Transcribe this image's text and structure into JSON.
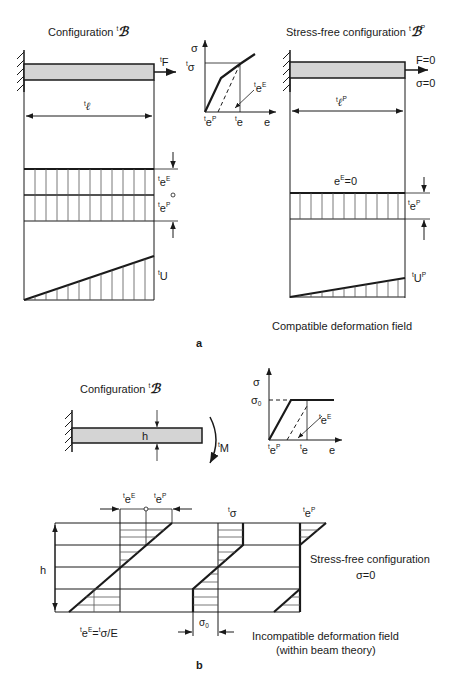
{
  "panel_a": {
    "label": "a",
    "left": {
      "title": "Configuration ",
      "title_symbol": "ℬ",
      "force_label": "F",
      "length_label": "ℓ",
      "eE_label": "e",
      "eE_sup": "E",
      "eP_label": "e",
      "eP_sup": "P",
      "U_label": "U"
    },
    "stress_strain": {
      "y_axis": "σ",
      "y_tick": "σ",
      "x_axis": "e",
      "x_tick_1": "e",
      "x_tick_1_sup": "P",
      "x_tick_2": "e",
      "eE_label": "e",
      "eE_sup": "E"
    },
    "right": {
      "title": "Stress-free configuration ",
      "title_symbol": "ℬ",
      "title_sup": "P",
      "force_label": "F=0",
      "stress_label": "σ=0",
      "length_label": "ℓ",
      "length_sup": "P",
      "eE_zero_label": "e",
      "eE_zero_sup": "E",
      "eE_zero_val": "=0",
      "eP_label": "e",
      "eP_sup": "P",
      "UP_label": "U",
      "UP_sup": "P"
    },
    "caption": "Compatible deformation field"
  },
  "panel_b": {
    "label": "b",
    "beam": {
      "title": "Configuration ",
      "title_symbol": "ℬ",
      "h_label": "h",
      "moment_label": "M"
    },
    "stress_strain": {
      "y_axis": "σ",
      "y_tick": "σ",
      "y_tick_sub": "0",
      "x_axis": "e",
      "x_tick_1": "e",
      "x_tick_1_sup": "P",
      "x_tick_2": "e",
      "eE_label": "e",
      "eE_sup": "E"
    },
    "profiles": {
      "h_label": "h",
      "eE_top": "e",
      "eE_top_sup": "E",
      "eP_top": "e",
      "eP_top_sup": "P",
      "sigma_label": "σ",
      "eP_right": "e",
      "eP_right_sup": "P",
      "sigma0": "σ",
      "sigma0_sub": "0",
      "eq_label_1": "e",
      "eq_label_1_sup": "E",
      "eq_label_2": "=",
      "eq_label_3": "σ/E"
    },
    "stress_free_title": "Stress-free configuration",
    "stress_free_sigma": "σ=0",
    "caption_line1": "Incompatible deformation field",
    "caption_line2": "(within beam theory)"
  },
  "colors": {
    "ink": "#1a1a1a",
    "beam_fill": "#d4d4d4",
    "thin_line": "#444444"
  }
}
